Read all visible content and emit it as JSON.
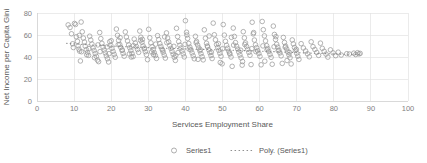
{
  "chart_data": {
    "type": "scatter",
    "title": "",
    "xlabel": "Services Employment Share",
    "ylabel": "Net Income per Capita Gini",
    "xlim": [
      0,
      100
    ],
    "ylim": [
      0,
      80
    ],
    "xticks": [
      "0",
      "10",
      "20",
      "30",
      "40",
      "50",
      "60",
      "70",
      "80",
      "90",
      "100"
    ],
    "yticks": [
      "0",
      "20",
      "40",
      "60",
      "80"
    ],
    "grid": true,
    "legend_position": "bottom",
    "marker_style": "open-circle",
    "marker_color": "#9a9a9a",
    "trendline_color": "#8c8c8c",
    "gridline_color": "#e3e3e3",
    "series": [
      {
        "name": "Series1",
        "type": "scatter",
        "points": [
          [
            8.4,
            69.2
          ],
          [
            8.9,
            66.8
          ],
          [
            9.3,
            61.1
          ],
          [
            9.6,
            52.0
          ],
          [
            9.8,
            48.6
          ],
          [
            10.1,
            70.5
          ],
          [
            10.4,
            69.6
          ],
          [
            10.6,
            58.4
          ],
          [
            10.9,
            54.3
          ],
          [
            11.1,
            50.2
          ],
          [
            11.3,
            47.1
          ],
          [
            11.5,
            45.3
          ],
          [
            11.7,
            36.4
          ],
          [
            11.9,
            71.8
          ],
          [
            12.2,
            62.9
          ],
          [
            12.5,
            57.2
          ],
          [
            12.8,
            53.6
          ],
          [
            13.0,
            49.9
          ],
          [
            13.3,
            46.7
          ],
          [
            13.6,
            44.1
          ],
          [
            13.9,
            41.5
          ],
          [
            14.2,
            58.9
          ],
          [
            14.5,
            55.4
          ],
          [
            14.8,
            51.8
          ],
          [
            15.1,
            48.3
          ],
          [
            15.4,
            45.9
          ],
          [
            15.7,
            43.2
          ],
          [
            16.0,
            40.6
          ],
          [
            16.3,
            37.2
          ],
          [
            16.6,
            35.8
          ],
          [
            16.9,
            62.3
          ],
          [
            17.2,
            56.7
          ],
          [
            17.5,
            52.4
          ],
          [
            17.8,
            49.1
          ],
          [
            18.1,
            46.3
          ],
          [
            18.4,
            43.7
          ],
          [
            18.7,
            41.0
          ],
          [
            19.0,
            38.4
          ],
          [
            19.3,
            35.5
          ],
          [
            19.6,
            53.9
          ],
          [
            19.9,
            50.6
          ],
          [
            20.2,
            47.8
          ],
          [
            20.5,
            45.1
          ],
          [
            20.8,
            42.4
          ],
          [
            21.1,
            39.8
          ],
          [
            21.4,
            65.4
          ],
          [
            21.7,
            59.7
          ],
          [
            22.0,
            55.1
          ],
          [
            22.3,
            51.4
          ],
          [
            22.6,
            48.7
          ],
          [
            22.9,
            46.0
          ],
          [
            23.2,
            43.3
          ],
          [
            23.5,
            40.7
          ],
          [
            23.8,
            62.8
          ],
          [
            24.1,
            58.2
          ],
          [
            24.4,
            54.6
          ],
          [
            24.7,
            51.0
          ],
          [
            25.0,
            48.4
          ],
          [
            25.3,
            45.8
          ],
          [
            25.6,
            43.1
          ],
          [
            25.9,
            40.4
          ],
          [
            26.2,
            56.3
          ],
          [
            26.5,
            52.7
          ],
          [
            26.8,
            49.5
          ],
          [
            27.1,
            46.8
          ],
          [
            27.4,
            44.2
          ],
          [
            27.7,
            63.6
          ],
          [
            28.0,
            58.0
          ],
          [
            28.3,
            53.4
          ],
          [
            28.6,
            50.1
          ],
          [
            28.9,
            47.4
          ],
          [
            29.2,
            44.8
          ],
          [
            29.5,
            42.1
          ],
          [
            29.8,
            37.6
          ],
          [
            30.1,
            65.2
          ],
          [
            30.4,
            57.5
          ],
          [
            30.7,
            52.9
          ],
          [
            31.0,
            49.3
          ],
          [
            31.3,
            46.6
          ],
          [
            31.6,
            44.0
          ],
          [
            31.9,
            41.3
          ],
          [
            32.2,
            38.7
          ],
          [
            32.5,
            59.4
          ],
          [
            32.8,
            55.8
          ],
          [
            33.1,
            52.2
          ],
          [
            33.4,
            49.6
          ],
          [
            33.7,
            47.0
          ],
          [
            34.0,
            44.3
          ],
          [
            34.3,
            41.7
          ],
          [
            34.6,
            39.0
          ],
          [
            34.9,
            61.9
          ],
          [
            35.2,
            57.3
          ],
          [
            35.5,
            53.7
          ],
          [
            35.8,
            50.4
          ],
          [
            36.1,
            47.8
          ],
          [
            36.4,
            45.1
          ],
          [
            36.7,
            42.5
          ],
          [
            37.0,
            39.8
          ],
          [
            37.3,
            36.9
          ],
          [
            37.6,
            66.1
          ],
          [
            37.9,
            58.6
          ],
          [
            38.2,
            54.0
          ],
          [
            38.5,
            50.7
          ],
          [
            38.8,
            48.1
          ],
          [
            39.1,
            45.4
          ],
          [
            39.4,
            42.8
          ],
          [
            39.7,
            40.1
          ],
          [
            40.0,
            73.0
          ],
          [
            40.3,
            62.5
          ],
          [
            40.6,
            56.9
          ],
          [
            40.9,
            52.3
          ],
          [
            41.2,
            49.0
          ],
          [
            41.5,
            46.4
          ],
          [
            41.8,
            43.7
          ],
          [
            42.1,
            41.1
          ],
          [
            42.4,
            38.4
          ],
          [
            42.7,
            58.8
          ],
          [
            43.0,
            54.2
          ],
          [
            43.3,
            50.9
          ],
          [
            43.6,
            48.3
          ],
          [
            43.9,
            45.6
          ],
          [
            44.2,
            43.0
          ],
          [
            44.5,
            40.3
          ],
          [
            44.8,
            37.4
          ],
          [
            45.1,
            64.7
          ],
          [
            45.4,
            57.1
          ],
          [
            45.7,
            52.5
          ],
          [
            46.0,
            49.2
          ],
          [
            46.3,
            46.6
          ],
          [
            46.6,
            43.9
          ],
          [
            46.9,
            41.3
          ],
          [
            47.2,
            38.6
          ],
          [
            47.5,
            70.8
          ],
          [
            47.8,
            60.2
          ],
          [
            48.1,
            55.6
          ],
          [
            48.4,
            51.3
          ],
          [
            48.7,
            48.7
          ],
          [
            49.0,
            46.0
          ],
          [
            49.3,
            43.4
          ],
          [
            49.6,
            40.7
          ],
          [
            49.9,
            33.8
          ],
          [
            50.2,
            69.5
          ],
          [
            50.5,
            59.9
          ],
          [
            50.8,
            54.3
          ],
          [
            51.1,
            50.6
          ],
          [
            51.4,
            48.0
          ],
          [
            51.7,
            45.3
          ],
          [
            52.0,
            42.7
          ],
          [
            52.3,
            40.0
          ],
          [
            52.6,
            31.5
          ],
          [
            52.9,
            66.3
          ],
          [
            53.2,
            58.7
          ],
          [
            53.5,
            53.1
          ],
          [
            53.8,
            49.8
          ],
          [
            54.1,
            47.2
          ],
          [
            54.4,
            44.5
          ],
          [
            54.7,
            41.9
          ],
          [
            55.0,
            39.2
          ],
          [
            55.3,
            32.6
          ],
          [
            55.6,
            63.0
          ],
          [
            55.9,
            57.4
          ],
          [
            56.2,
            52.8
          ],
          [
            56.5,
            49.5
          ],
          [
            56.8,
            46.9
          ],
          [
            57.1,
            44.2
          ],
          [
            57.4,
            41.6
          ],
          [
            57.7,
            33.1
          ],
          [
            58.0,
            71.6
          ],
          [
            58.3,
            61.0
          ],
          [
            58.6,
            55.4
          ],
          [
            58.9,
            51.1
          ],
          [
            59.2,
            48.5
          ],
          [
            59.5,
            45.8
          ],
          [
            59.8,
            43.2
          ],
          [
            60.1,
            40.5
          ],
          [
            60.4,
            32.9
          ],
          [
            60.7,
            72.3
          ],
          [
            61.0,
            64.8
          ],
          [
            61.3,
            59.2
          ],
          [
            61.6,
            54.6
          ],
          [
            61.9,
            50.3
          ],
          [
            62.2,
            47.7
          ],
          [
            62.5,
            45.0
          ],
          [
            62.8,
            42.4
          ],
          [
            63.1,
            39.7
          ],
          [
            63.4,
            33.4
          ],
          [
            63.7,
            68.1
          ],
          [
            64.0,
            60.5
          ],
          [
            64.3,
            55.9
          ],
          [
            64.6,
            51.6
          ],
          [
            64.9,
            49.0
          ],
          [
            65.2,
            46.3
          ],
          [
            65.5,
            43.7
          ],
          [
            65.8,
            41.0
          ],
          [
            66.1,
            34.2
          ],
          [
            66.4,
            57.8
          ],
          [
            66.7,
            53.2
          ],
          [
            67.0,
            49.9
          ],
          [
            67.3,
            47.3
          ],
          [
            67.6,
            44.6
          ],
          [
            67.9,
            42.0
          ],
          [
            68.2,
            39.3
          ],
          [
            68.5,
            33.7
          ],
          [
            68.8,
            55.5
          ],
          [
            69.1,
            51.9
          ],
          [
            69.4,
            48.6
          ],
          [
            69.7,
            46.0
          ],
          [
            70.0,
            43.4
          ],
          [
            70.3,
            40.7
          ],
          [
            70.6,
            37.8
          ],
          [
            71.2,
            52.1
          ],
          [
            71.8,
            48.2
          ],
          [
            72.4,
            45.5
          ],
          [
            72.9,
            42.9
          ],
          [
            73.4,
            40.2
          ],
          [
            73.9,
            53.8
          ],
          [
            74.4,
            49.4
          ],
          [
            74.9,
            46.8
          ],
          [
            75.4,
            44.1
          ],
          [
            75.9,
            41.5
          ],
          [
            76.4,
            52.6
          ],
          [
            76.9,
            47.9
          ],
          [
            77.4,
            45.2
          ],
          [
            77.9,
            42.6
          ],
          [
            78.4,
            39.9
          ],
          [
            79.1,
            46.5
          ],
          [
            79.8,
            43.8
          ],
          [
            80.5,
            41.2
          ],
          [
            81.2,
            44.4
          ],
          [
            82.0,
            41.8
          ],
          [
            83.5,
            43.0
          ],
          [
            84.2,
            42.7
          ],
          [
            85.4,
            43.5
          ],
          [
            85.9,
            42.2
          ],
          [
            86.4,
            43.9
          ],
          [
            86.8,
            42.8
          ],
          [
            87.1,
            43.3
          ],
          [
            12.0,
            44.8
          ],
          [
            14.0,
            47.6
          ],
          [
            15.5,
            39.4
          ],
          [
            17.0,
            44.9
          ],
          [
            18.9,
            49.2
          ],
          [
            20.0,
            54.8
          ],
          [
            21.9,
            51.2
          ],
          [
            23.0,
            46.4
          ],
          [
            24.9,
            42.8
          ],
          [
            26.0,
            50.3
          ],
          [
            27.9,
            55.2
          ],
          [
            29.0,
            48.0
          ],
          [
            30.9,
            44.6
          ],
          [
            32.0,
            51.7
          ],
          [
            33.9,
            46.1
          ],
          [
            35.0,
            53.0
          ],
          [
            36.9,
            49.7
          ],
          [
            38.0,
            44.0
          ],
          [
            39.9,
            51.5
          ],
          [
            41.0,
            47.2
          ],
          [
            42.9,
            52.9
          ],
          [
            44.0,
            46.7
          ],
          [
            45.9,
            50.0
          ],
          [
            47.0,
            44.4
          ],
          [
            48.9,
            52.1
          ],
          [
            50.0,
            47.5
          ],
          [
            51.9,
            43.6
          ],
          [
            53.0,
            50.8
          ],
          [
            54.9,
            46.2
          ],
          [
            56.0,
            51.4
          ],
          [
            57.9,
            47.6
          ],
          [
            59.0,
            44.9
          ],
          [
            60.9,
            50.1
          ],
          [
            62.0,
            46.5
          ],
          [
            63.9,
            49.3
          ],
          [
            65.0,
            45.7
          ],
          [
            66.9,
            48.8
          ],
          [
            68.0,
            44.2
          ],
          [
            69.9,
            47.0
          ],
          [
            11.4,
            59.6
          ],
          [
            13.4,
            42.0
          ],
          [
            16.4,
            51.0
          ],
          [
            19.4,
            43.0
          ],
          [
            22.4,
            57.6
          ],
          [
            25.4,
            40.0
          ],
          [
            28.4,
            56.0
          ],
          [
            31.4,
            42.2
          ],
          [
            34.4,
            58.3
          ],
          [
            37.4,
            41.4
          ],
          [
            40.4,
            60.0
          ],
          [
            43.4,
            37.9
          ],
          [
            46.4,
            59.1
          ],
          [
            49.4,
            35.0
          ],
          [
            52.4,
            57.9
          ],
          [
            55.4,
            35.9
          ],
          [
            58.4,
            62.2
          ],
          [
            61.4,
            36.2
          ],
          [
            64.4,
            58.5
          ],
          [
            67.4,
            36.8
          ]
        ]
      },
      {
        "name": "Poly. (Series1)",
        "type": "trendline-poly",
        "points": [
          [
            8.0,
            52.4
          ],
          [
            14.0,
            51.1
          ],
          [
            20.0,
            50.0
          ],
          [
            26.0,
            49.1
          ],
          [
            32.0,
            48.3
          ],
          [
            38.0,
            47.6
          ],
          [
            44.0,
            47.0
          ],
          [
            50.0,
            46.4
          ],
          [
            56.0,
            45.8
          ],
          [
            62.0,
            45.1
          ],
          [
            68.0,
            44.3
          ],
          [
            74.0,
            43.5
          ],
          [
            80.0,
            42.8
          ],
          [
            87.0,
            42.2
          ]
        ]
      }
    ]
  },
  "legend": {
    "items": [
      {
        "label": "Series1",
        "marker": "circle-marker"
      },
      {
        "label": "Poly. (Series1)",
        "marker": "dotted-line-marker"
      }
    ]
  }
}
